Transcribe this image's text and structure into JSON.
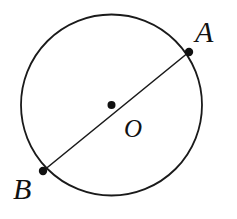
{
  "figure": {
    "type": "geometry-diagram",
    "background_color": "#ffffff",
    "stroke_color": "#1a1a1a",
    "labels": {
      "point_a": "A",
      "point_b": "B",
      "center": "O"
    },
    "geometry": {
      "circle": {
        "center_x": 111.5,
        "center_y": 105,
        "radius": 90.5,
        "stroke_width": 1.8
      },
      "diameter": {
        "x1": 189,
        "y1": 52,
        "x2": 43,
        "y2": 171,
        "stroke_width": 1.6
      },
      "points": [
        {
          "name": "A",
          "x": 189,
          "y": 52,
          "radius": 4.2
        },
        {
          "name": "O",
          "x": 111.5,
          "y": 105,
          "radius": 4.0
        },
        {
          "name": "B",
          "x": 43,
          "y": 171,
          "radius": 4.2
        }
      ]
    }
  }
}
